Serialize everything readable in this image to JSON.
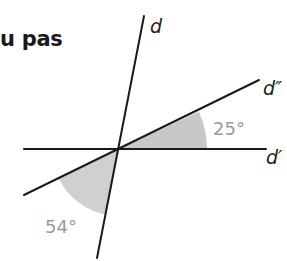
{
  "heading": {
    "text": "u pas"
  },
  "figure": {
    "lines": [
      {
        "name": "d",
        "label": "d"
      },
      {
        "name": "d-prime",
        "label": "d′"
      },
      {
        "name": "d-double-prime",
        "label": "d″"
      }
    ],
    "angles": [
      {
        "name": "angle-25",
        "label": "25°",
        "value_deg": 25,
        "between": [
          "d′",
          "d″"
        ]
      },
      {
        "name": "angle-54",
        "label": "54°",
        "value_deg": 54,
        "between": [
          "d″",
          "d"
        ]
      }
    ],
    "colors": {
      "line": "#1a1a1a",
      "sector_fill": "#c8c8c8",
      "angle_label": "#9a9a9a"
    }
  }
}
